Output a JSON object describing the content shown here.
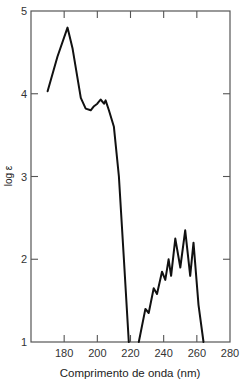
{
  "chart_data": {
    "type": "line",
    "title": "",
    "xlabel": "Comprimento de onda (nm)",
    "ylabel": "log ε",
    "xlim": [
      160,
      280
    ],
    "ylim": [
      1,
      5
    ],
    "xticks": [
      180,
      200,
      220,
      240,
      260,
      280
    ],
    "yticks": [
      1,
      2,
      3,
      4,
      5
    ],
    "grid": false,
    "legend": null,
    "series": [
      {
        "name": "UV absorption spectrum",
        "color": "#111111",
        "x": [
          170,
          176,
          182,
          185,
          190,
          193,
          196,
          198,
          200,
          202,
          204,
          205,
          207,
          210,
          213,
          216,
          219
        ],
        "y": [
          4.03,
          4.45,
          4.8,
          4.55,
          3.95,
          3.82,
          3.8,
          3.85,
          3.88,
          3.93,
          3.88,
          3.92,
          3.8,
          3.6,
          3.0,
          2.0,
          1.0
        ]
      },
      {
        "name": "UV absorption spectrum (fine structure)",
        "color": "#111111",
        "x": [
          225,
          229,
          231,
          234,
          236,
          239,
          241,
          243,
          244.5,
          247,
          250,
          253,
          256,
          258,
          261,
          264
        ],
        "y": [
          1.0,
          1.4,
          1.35,
          1.65,
          1.58,
          1.85,
          1.75,
          2.0,
          1.8,
          2.25,
          1.9,
          2.35,
          1.8,
          2.2,
          1.45,
          1.0
        ]
      }
    ]
  },
  "frame": {
    "left": 31,
    "right": 230,
    "top": 11,
    "bottom": 342
  },
  "axis_color": "#555555"
}
